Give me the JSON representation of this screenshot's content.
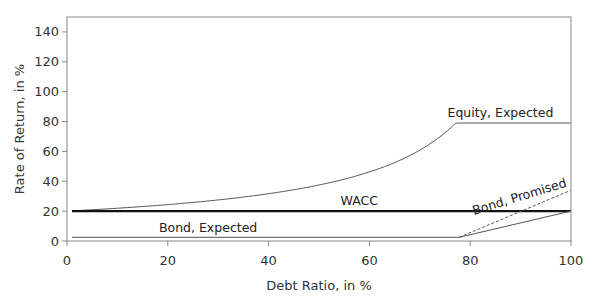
{
  "chart_data": {
    "type": "line",
    "title": "",
    "xlabel": "Debt Ratio, in %",
    "ylabel": "Rate of Return, in %",
    "xlim": [
      0,
      100
    ],
    "ylim": [
      0,
      150
    ],
    "xticks": [
      0,
      20,
      40,
      60,
      80,
      100
    ],
    "yticks": [
      0,
      20,
      40,
      60,
      80,
      100,
      120,
      140
    ],
    "grid": false,
    "legend": "inline labels",
    "series": [
      {
        "name": "Equity, Expected",
        "style": "solid-thin",
        "color": "#555555",
        "x": [
          1,
          10,
          20,
          30,
          40,
          50,
          60,
          65,
          70,
          75,
          77.8,
          100
        ],
        "y": [
          20.2,
          21.9,
          24.4,
          27.5,
          31.7,
          37.5,
          46.3,
          52.5,
          60.8,
          72.5,
          79,
          79
        ]
      },
      {
        "name": "WACC",
        "style": "solid-thick",
        "color": "#111111",
        "x": [
          1,
          100
        ],
        "y": [
          20,
          20
        ]
      },
      {
        "name": "Bond, Expected",
        "style": "solid-thin",
        "color": "#555555",
        "x": [
          1,
          77.8,
          100
        ],
        "y": [
          2.5,
          2.5,
          20
        ]
      },
      {
        "name": "Bond, Promised",
        "style": "dashed",
        "color": "#555555",
        "x": [
          77.8,
          100
        ],
        "y": [
          2.5,
          34
        ]
      }
    ],
    "annotations": [
      {
        "text": "Equity, Expected",
        "x": 86,
        "y": 83
      },
      {
        "text": "WACC",
        "x": 58,
        "y": 24
      },
      {
        "text": "Bond, Expected",
        "x": 28,
        "y": 6
      },
      {
        "text": "Bond, Promised",
        "x": 90,
        "y": 27,
        "rotation": -17
      }
    ]
  }
}
